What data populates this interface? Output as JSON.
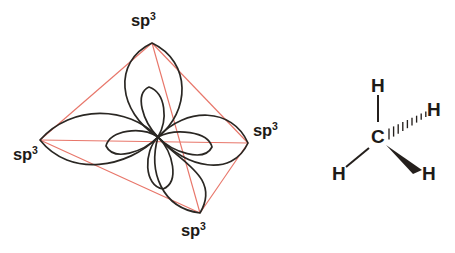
{
  "figure": {
    "background_color": "#ffffff"
  },
  "colors": {
    "orbital_outline": "#2a2723",
    "tetrahedron_edge": "#e8766a",
    "bond": "#241f1c",
    "label_text": "#1d1a17"
  },
  "orbital_diagram": {
    "name": "sp3-hybrid-orbital-tetrahedron",
    "center": {
      "x": 158,
      "y": 137
    },
    "vertices": [
      {
        "id": "top",
        "x": 152,
        "y": 43,
        "label_text": "sp",
        "label_sup": "3",
        "label_x": 131,
        "label_y": 12
      },
      {
        "id": "right",
        "x": 248,
        "y": 143,
        "label_text": "sp",
        "label_sup": "3",
        "label_x": 253,
        "label_y": 122
      },
      {
        "id": "bottom",
        "x": 200,
        "y": 213,
        "label_text": "sp",
        "label_sup": "3",
        "label_x": 181,
        "label_y": 222
      },
      {
        "id": "left",
        "x": 40,
        "y": 140,
        "label_text": "sp",
        "label_sup": "3",
        "label_x": 13,
        "label_y": 146
      }
    ],
    "edges": [
      [
        "top",
        "right"
      ],
      [
        "top",
        "bottom"
      ],
      [
        "top",
        "left"
      ],
      [
        "right",
        "bottom"
      ],
      [
        "right",
        "left"
      ],
      [
        "bottom",
        "left"
      ]
    ],
    "lobe_count": 4,
    "back_lobe_count": 4
  },
  "methane_diagram": {
    "name": "methane-structural-formula",
    "central_atom": {
      "symbol": "C",
      "x": 378,
      "y": 137
    },
    "hydrogens": [
      {
        "id": "h-top",
        "symbol": "H",
        "x": 378,
        "y": 85,
        "bond_type": "plain-line"
      },
      {
        "id": "h-right",
        "symbol": "H",
        "x": 433,
        "y": 110,
        "bond_type": "hashed-wedge"
      },
      {
        "id": "h-lower-left",
        "symbol": "H",
        "x": 339,
        "y": 174,
        "bond_type": "plain-line"
      },
      {
        "id": "h-lower-right",
        "symbol": "H",
        "x": 428,
        "y": 174,
        "bond_type": "solid-wedge"
      }
    ],
    "hash_mark_count": 9
  }
}
